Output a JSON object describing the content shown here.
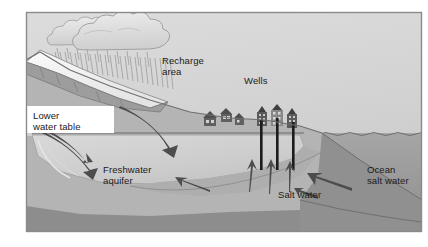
{
  "figure": {
    "kind": "cross-section-diagram",
    "width": 428,
    "height": 247
  },
  "labels": {
    "recharge_area": "Recharge\narea",
    "wells": "Wells",
    "lower_water_table": "Lower\nwater table",
    "freshwater_aquifer": "Freshwater\naquifer",
    "salt_water": "Salt water",
    "ocean_salt_water": "Ocean\nsalt water"
  },
  "colors": {
    "sky": "#d2d2d2",
    "frame_border": "#8a8a8a",
    "page_background": "#ffffff",
    "land_upper": "#b8b8b8",
    "land_mid": "#a8a8a8",
    "bedrock": "#8f8f8f",
    "aquifer": "#cfcfcf",
    "salt_wedge": "#b0b0b0",
    "ocean_water": "#9a9a9a",
    "seabed": "#8a8a8a",
    "cloud": "#e2e2e2",
    "cloud_outline": "#9b9b9b",
    "mountain_snow": "#f2f2f2",
    "mountain_rock": "#9e9e9e",
    "well_casing": "#1c1c1c",
    "building": "#5a5a5a",
    "arrow_dark": "#4d4d4d",
    "water_table_line": "#6b6b6b",
    "label_text": "#1a1a1a",
    "rain_streak": "#9c9c9c"
  },
  "elements": {
    "clouds": 2,
    "rain_streaks": 34,
    "houses": 3,
    "tall_buildings": 3,
    "well_casings": 3,
    "recharge_arrows": 2,
    "upwelling_arrows": 3,
    "intrusion_arrows": 2,
    "water_table_visible": true
  },
  "label_positions": {
    "recharge_area": {
      "x": 162,
      "y": 59
    },
    "wells": {
      "x": 244,
      "y": 79
    },
    "lower_water_table": {
      "x": 11,
      "y": 114
    },
    "freshwater_aquifer": {
      "x": 103,
      "y": 168
    },
    "salt_water": {
      "x": 278,
      "y": 193
    },
    "ocean_salt_water": {
      "x": 367,
      "y": 168
    }
  }
}
